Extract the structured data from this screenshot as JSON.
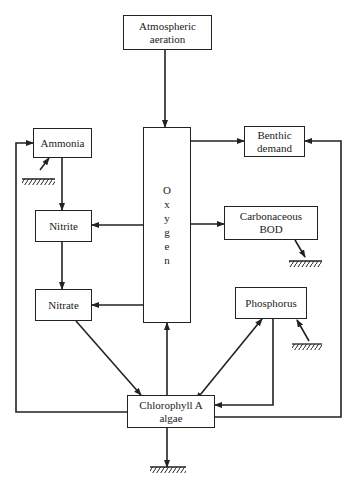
{
  "diagram": {
    "nodes": {
      "aeration": {
        "line1": "Atmospheric",
        "line2": "aeration"
      },
      "oxygen": {
        "letters": [
          "O",
          "x",
          "y",
          "g",
          "e",
          "n"
        ]
      },
      "ammonia": {
        "label": "Ammonia"
      },
      "benthic": {
        "line1": "Benthic",
        "line2": "demand"
      },
      "nitrite": {
        "label": "Nitrite"
      },
      "cbod": {
        "line1": "Carbonaceous",
        "line2": "BOD"
      },
      "nitrate": {
        "label": "Nitrate"
      },
      "phosphorus": {
        "label": "Phosphorus"
      },
      "chlorophyll": {
        "line1": "Chlorophyll A",
        "line2": "algae"
      }
    },
    "edges": [
      {
        "from": "aeration",
        "to": "oxygen"
      },
      {
        "from": "oxygen",
        "to": "benthic"
      },
      {
        "from": "oxygen",
        "to": "nitrite"
      },
      {
        "from": "oxygen",
        "to": "cbod"
      },
      {
        "from": "oxygen",
        "to": "nitrate"
      },
      {
        "from": "ammonia",
        "to": "nitrite"
      },
      {
        "from": "nitrite",
        "to": "nitrate"
      },
      {
        "from": "nitrate",
        "to": "chlorophyll"
      },
      {
        "from": "chlorophyll",
        "to": "oxygen"
      },
      {
        "from": "chlorophyll",
        "to": "phosphorus",
        "bidirectional": true
      },
      {
        "from": "phosphorus",
        "to": "chlorophyll"
      },
      {
        "from": "chlorophyll",
        "to": "ammonia"
      },
      {
        "from": "chlorophyll",
        "to": "benthic"
      },
      {
        "from": "sediment",
        "to": "ammonia"
      },
      {
        "from": "cbod",
        "to": "sediment"
      },
      {
        "from": "sediment",
        "to": "phosphorus"
      },
      {
        "from": "chlorophyll",
        "to": "sediment"
      }
    ]
  }
}
